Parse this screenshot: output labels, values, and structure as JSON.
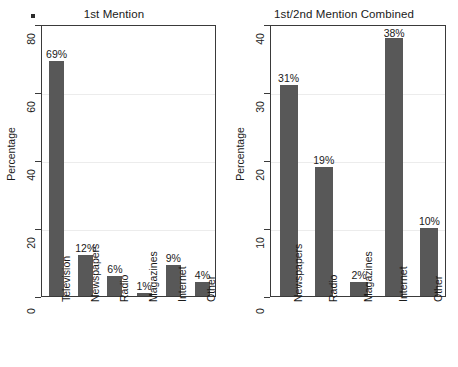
{
  "figure": {
    "background_color": "#ffffff",
    "bar_color": "#585858",
    "axis_color": "#3a3a3a",
    "gridline_color": "#ececec"
  },
  "artifact": {
    "name": "scan-speck"
  },
  "chart_data": [
    {
      "type": "bar",
      "title": "1st Mention",
      "xlabel": "",
      "ylabel": "Percentage",
      "categories": [
        "Television",
        "Newspapers",
        "Radio",
        "Magazines",
        "Internet",
        "Other"
      ],
      "values": [
        69,
        12,
        6,
        1,
        9,
        4
      ],
      "data_labels": [
        "69%",
        "12%",
        "6%",
        "1%",
        "9%",
        "4%"
      ],
      "ylim": [
        0,
        80
      ],
      "yticks": [
        0,
        20,
        40,
        60,
        80
      ],
      "ytick_labels": [
        "0",
        "20",
        "40",
        "60",
        "80"
      ],
      "grid": true,
      "legend": "none"
    },
    {
      "type": "bar",
      "title": "1st/2nd Mention Combined",
      "xlabel": "",
      "ylabel": "Percentage",
      "categories": [
        "Newspapers",
        "Radio",
        "Magazines",
        "Internet",
        "Other"
      ],
      "values": [
        31,
        19,
        2,
        38,
        10
      ],
      "data_labels": [
        "31%",
        "19%",
        "2%",
        "38%",
        "10%"
      ],
      "ylim": [
        0,
        40
      ],
      "yticks": [
        0,
        10,
        20,
        30,
        40
      ],
      "ytick_labels": [
        "0",
        "10",
        "20",
        "30",
        "40"
      ],
      "grid": true,
      "legend": "none"
    }
  ]
}
